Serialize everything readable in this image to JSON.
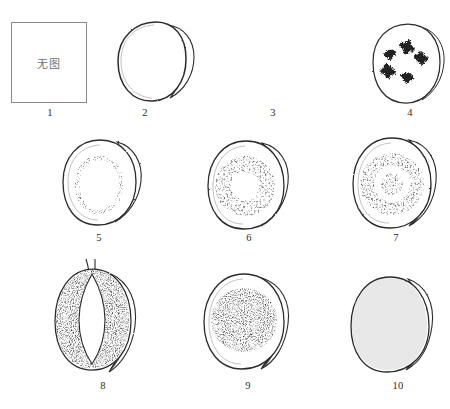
{
  "figure": {
    "type": "scientific-illustration-plate",
    "background_color": "#ffffff",
    "ink_color": "#2b2b2b",
    "placeholder_border_color": "#8a8a8a",
    "placeholder_text_color": "#6f6f6f",
    "rows": 3,
    "columns": 4,
    "total_panels": 10
  },
  "placeholder": {
    "label": "无图",
    "meaning": "no image"
  },
  "panels": [
    {
      "number": "1",
      "kind": "placeholder-box",
      "text": "无图",
      "caption": "1"
    },
    {
      "number": "2",
      "kind": "outline-only",
      "description": "plain rounded cross-section outline with crescent rim at right",
      "fill": "none",
      "caption": "2"
    },
    {
      "number": "3",
      "kind": "stippled-outer-ring",
      "description": "dense stippled band following the outer margin, hollow centre",
      "fill": "peripheral-band",
      "caption": "3"
    },
    {
      "number": "4",
      "kind": "scattered-clusters",
      "description": "five small star-like dark clusters scattered in the interior",
      "cluster_count": 5,
      "caption": "4"
    },
    {
      "number": "5",
      "kind": "inner-oval-outline",
      "description": "inner oval delimited by a fine stippled line, clear interior",
      "fill": "ring-outline",
      "caption": "5"
    },
    {
      "number": "6",
      "kind": "stippled-annulus",
      "description": "thick stippled annulus inside a clear outer zone, hollow core",
      "fill": "annulus",
      "caption": "6"
    },
    {
      "number": "7",
      "kind": "annulus-with-core",
      "description": "stippled annulus plus a separate stippled central core",
      "fill": "annulus-plus-core",
      "caption": "7"
    },
    {
      "number": "8",
      "kind": "lens-cavity",
      "description": "stippled body enclosing an almond/lens shaped clear cavity, two small stalks at apex",
      "fill": "body-with-lens-void",
      "stalks": 2,
      "caption": "8"
    },
    {
      "number": "9",
      "kind": "stippled-disc",
      "description": "large solid stippled disc centred within a clear outer rim",
      "fill": "central-disc",
      "caption": "9"
    },
    {
      "number": "10",
      "kind": "fully-stippled",
      "description": "entire cross-section filled with even stipple texture",
      "fill": "full",
      "caption": "10"
    }
  ],
  "captions": [
    "1",
    "2",
    "3",
    "4",
    "5",
    "6",
    "7",
    "8",
    "9",
    "10"
  ]
}
